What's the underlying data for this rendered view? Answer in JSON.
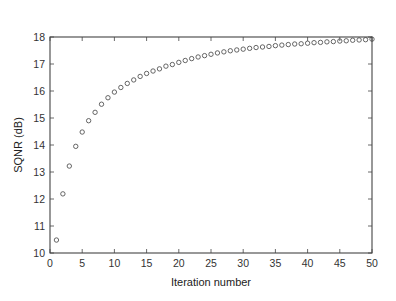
{
  "chart_data": {
    "type": "scatter",
    "title": "",
    "xlabel": "Iteration number",
    "ylabel": "SQNR (dB)",
    "xlim": [
      0,
      50
    ],
    "ylim": [
      10,
      18
    ],
    "xticks": [
      0,
      5,
      10,
      15,
      20,
      25,
      30,
      35,
      40,
      45,
      50
    ],
    "yticks": [
      10,
      11,
      12,
      13,
      14,
      15,
      16,
      17,
      18
    ],
    "grid": false,
    "legend": null,
    "marker": "open-circle",
    "series": [
      {
        "name": "SQNR",
        "x": [
          1,
          2,
          3,
          4,
          5,
          6,
          7,
          8,
          9,
          10,
          11,
          12,
          13,
          14,
          15,
          16,
          17,
          18,
          19,
          20,
          21,
          22,
          23,
          24,
          25,
          26,
          27,
          28,
          29,
          30,
          31,
          32,
          33,
          34,
          35,
          36,
          37,
          38,
          39,
          40,
          41,
          42,
          43,
          44,
          45,
          46,
          47,
          48,
          49,
          50
        ],
        "values": [
          10.48,
          12.19,
          13.22,
          13.95,
          14.48,
          14.9,
          15.21,
          15.51,
          15.75,
          15.96,
          16.13,
          16.28,
          16.41,
          16.54,
          16.65,
          16.74,
          16.82,
          16.92,
          16.98,
          17.06,
          17.13,
          17.2,
          17.26,
          17.31,
          17.36,
          17.41,
          17.45,
          17.49,
          17.52,
          17.55,
          17.58,
          17.61,
          17.63,
          17.65,
          17.68,
          17.7,
          17.72,
          17.74,
          17.75,
          17.77,
          17.79,
          17.8,
          17.82,
          17.83,
          17.85,
          17.86,
          17.88,
          17.89,
          17.9,
          17.92
        ]
      }
    ]
  },
  "colors": {
    "axis": "#444444",
    "marker": "#555555",
    "background": "#ffffff"
  }
}
